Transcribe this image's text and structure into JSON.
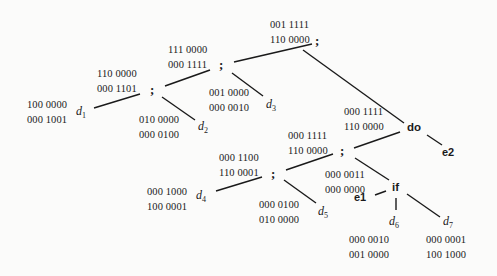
{
  "diagram": {
    "type": "syntax-tree",
    "nodes": {
      "root_seq": {
        "label": ";",
        "gen_kill": [
          "001 1111",
          "110 0000"
        ]
      },
      "seq_2": {
        "label": ";",
        "gen_kill": [
          "111 0000",
          "000 1111"
        ]
      },
      "seq_3": {
        "label": ";",
        "gen_kill": [
          "110 0000",
          "000 1101"
        ]
      },
      "d1": {
        "label": "d",
        "sub": "1",
        "gen_kill": [
          "100 0000",
          "000 1001"
        ]
      },
      "d2": {
        "label": "d",
        "sub": "2",
        "gen_kill": [
          "010 0000",
          "000 0100"
        ]
      },
      "d3": {
        "label": "d",
        "sub": "3",
        "gen_kill": [
          "001 0000",
          "000 0010"
        ]
      },
      "do": {
        "label": "do",
        "gen_kill": [
          "000 1111",
          "110 0000"
        ]
      },
      "e2": {
        "label": "e2"
      },
      "seq_4": {
        "label": ";",
        "gen_kill": [
          "000 1111",
          "110 0000"
        ]
      },
      "seq_5": {
        "label": ";",
        "gen_kill": [
          "000 1100",
          "110 0001"
        ]
      },
      "d4": {
        "label": "d",
        "sub": "4",
        "gen_kill": [
          "000 1000",
          "100 0001"
        ]
      },
      "d5": {
        "label": "d",
        "sub": "5",
        "gen_kill": [
          "000 0100",
          "010 0000"
        ]
      },
      "if": {
        "label": "if",
        "gen_kill": [
          "000 0011",
          "000 0000"
        ]
      },
      "e1": {
        "label": "e1"
      },
      "d6": {
        "label": "d",
        "sub": "6",
        "gen_kill": [
          "000 0010",
          "001 0000"
        ]
      },
      "d7": {
        "label": "d",
        "sub": "7",
        "gen_kill": [
          "000 0001",
          "100 1000"
        ]
      }
    },
    "edges": [
      [
        "root_seq",
        "seq_2"
      ],
      [
        "root_seq",
        "do"
      ],
      [
        "seq_2",
        "seq_3"
      ],
      [
        "seq_2",
        "d3"
      ],
      [
        "seq_3",
        "d1"
      ],
      [
        "seq_3",
        "d2"
      ],
      [
        "do",
        "seq_4"
      ],
      [
        "do",
        "e2"
      ],
      [
        "seq_4",
        "seq_5"
      ],
      [
        "seq_4",
        "if"
      ],
      [
        "seq_5",
        "d4"
      ],
      [
        "seq_5",
        "d5"
      ],
      [
        "if",
        "e1"
      ],
      [
        "if",
        "d6"
      ],
      [
        "if",
        "d7"
      ]
    ]
  }
}
